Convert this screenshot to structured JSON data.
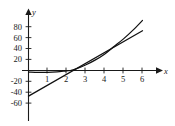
{
  "figure": {
    "axis_label_x": "x",
    "axis_label_y": "y",
    "background_color": "#ffffff",
    "ink_color": "#111111"
  },
  "chart_data": {
    "type": "line",
    "title": "",
    "subtitle": "",
    "xlabel": "x",
    "ylabel": "y",
    "xlim": [
      -0.35,
      6.6
    ],
    "ylim": [
      -68,
      96
    ],
    "grid": false,
    "legend": "none",
    "xticks": [
      1,
      2,
      3,
      4,
      5,
      6
    ],
    "xtick_labels": [
      "1",
      "2",
      "3",
      "4",
      "5",
      "6"
    ],
    "yticks": [
      -60,
      -40,
      -20,
      20,
      40,
      60,
      80
    ],
    "ytick_labels": [
      "-60",
      "-40",
      "-20",
      "20",
      "40",
      "60",
      "80"
    ],
    "annotations": [],
    "series": [
      {
        "name": "curve",
        "description": "smooth increasing convex curve passing just below the x-axis for small x, crossing near x=2.2 and rising to about y=92 at x=6",
        "x": [
          0,
          0.5,
          1,
          1.5,
          2,
          2.2,
          2.5,
          3,
          3.5,
          4,
          4.5,
          5,
          5.5,
          6
        ],
        "values": [
          -3,
          -3.5,
          -3.5,
          -2.5,
          -0.5,
          0,
          3,
          10,
          19,
          30,
          44,
          58,
          74,
          92
        ]
      },
      {
        "name": "tangent-line",
        "description": "straight line through the curve, y-intercept about -47, crossing the x-axis near x=2.5 and reaching about y=73 at x=6",
        "x": [
          0,
          6
        ],
        "values": [
          -47,
          73
        ]
      }
    ]
  }
}
